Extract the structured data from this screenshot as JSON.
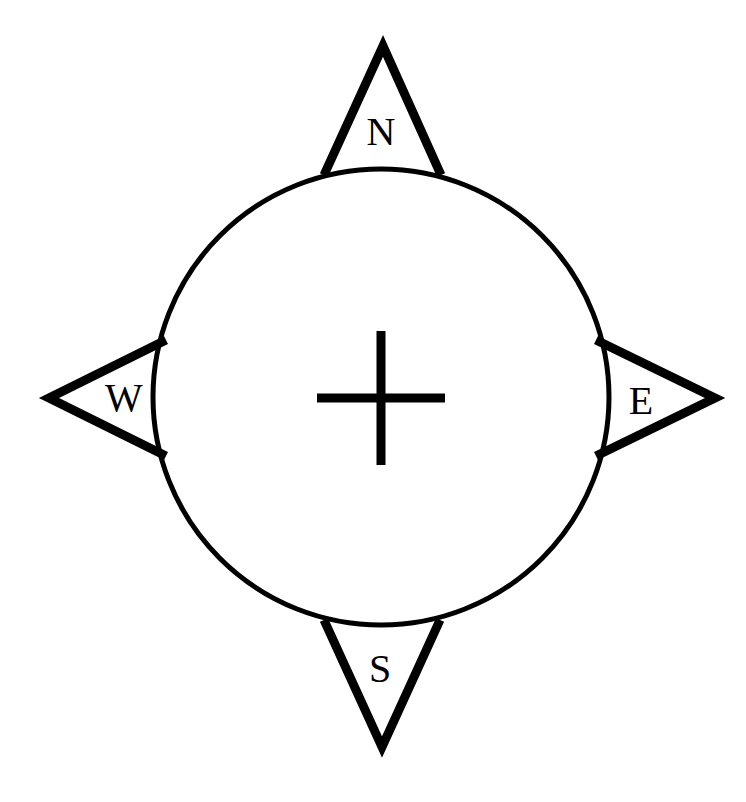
{
  "diagram": {
    "type": "compass-rose",
    "background_color": "#ffffff",
    "stroke_color": "#000000",
    "canvas": {
      "width": 746,
      "height": 802
    },
    "dial": {
      "center_x": 381,
      "center_y": 397,
      "radius": 228,
      "stroke_width": 5
    },
    "center_mark": {
      "name": "plus-cross",
      "center_x": 381,
      "center_y": 398,
      "half_width": 64,
      "half_height": 67,
      "stroke_width": 9
    },
    "cardinal_points": [
      {
        "id": "north",
        "label": "N",
        "direction": "North",
        "bearing_degrees": 0,
        "tip_x": 383,
        "tip_y": 45,
        "label_x": 381,
        "label_y": 131
      },
      {
        "id": "east",
        "label": "E",
        "direction": "East",
        "bearing_degrees": 90,
        "tip_x": 716,
        "tip_y": 398,
        "label_x": 641,
        "label_y": 400
      },
      {
        "id": "south",
        "label": "S",
        "direction": "South",
        "bearing_degrees": 180,
        "tip_x": 382,
        "tip_y": 748,
        "label_x": 380,
        "label_y": 668
      },
      {
        "id": "west",
        "label": "W",
        "direction": "West",
        "bearing_degrees": 270,
        "tip_x": 48,
        "tip_y": 398,
        "label_x": 124,
        "label_y": 397
      }
    ]
  }
}
